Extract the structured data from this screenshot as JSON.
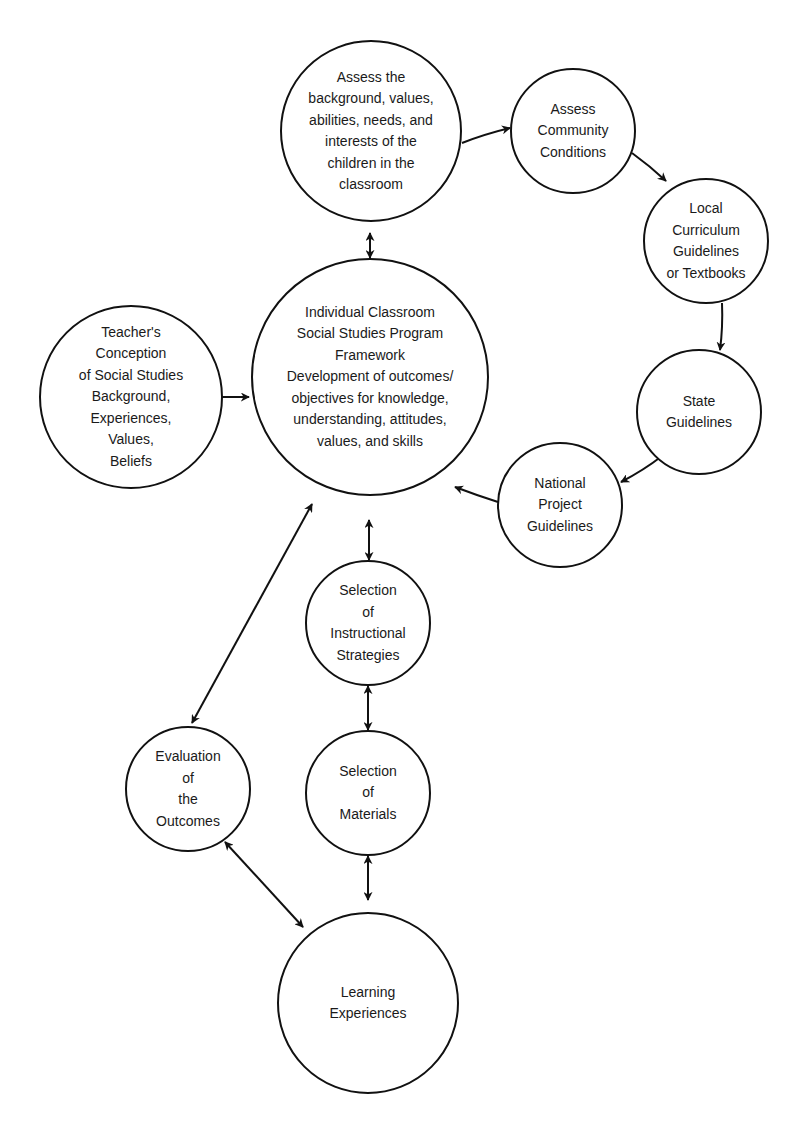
{
  "diagram": {
    "type": "flow-cycle",
    "colors": {
      "stroke": "#111111",
      "text": "#1a1a1a",
      "background": "#ffffff"
    },
    "nodes": [
      {
        "id": "assess-children",
        "label": "Assess the\nbackground, values,\nabilities, needs, and\ninterests of the\nchildren in the\nclassroom",
        "cx": 371,
        "cy": 131,
        "r": 90
      },
      {
        "id": "assess-community",
        "label": "Assess\nCommunity\nConditions",
        "cx": 573,
        "cy": 131,
        "r": 62
      },
      {
        "id": "local-curriculum",
        "label": "Local\nCurriculum\nGuidelines\nor Textbooks",
        "cx": 706,
        "cy": 241,
        "r": 62
      },
      {
        "id": "state-guidelines",
        "label": "State\nGuidelines",
        "cx": 699,
        "cy": 412,
        "r": 62
      },
      {
        "id": "national-project",
        "label": "National\nProject\nGuidelines",
        "cx": 560,
        "cy": 505,
        "r": 62
      },
      {
        "id": "individual-classroom",
        "label": "Individual Classroom\nSocial Studies Program\nFramework\nDevelopment of outcomes/\nobjectives for knowledge,\nunderstanding, attitudes,\nvalues, and skills",
        "cx": 370,
        "cy": 377,
        "r": 118
      },
      {
        "id": "teacher-conception",
        "label": "Teacher's\nConception\nof Social Studies\nBackground,\nExperiences,\nValues,\nBeliefs",
        "cx": 131,
        "cy": 397,
        "r": 91
      },
      {
        "id": "instructional-strategies",
        "label": "Selection\nof\nInstructional\nStrategies",
        "cx": 368,
        "cy": 623,
        "r": 62
      },
      {
        "id": "evaluation",
        "label": "Evaluation\nof\nthe\nOutcomes",
        "cx": 188,
        "cy": 789,
        "r": 62
      },
      {
        "id": "materials",
        "label": "Selection\nof\nMaterials",
        "cx": 368,
        "cy": 793,
        "r": 62
      },
      {
        "id": "learning-experiences",
        "label": "Learning\nExperiences",
        "cx": 368,
        "cy": 1003,
        "r": 90
      }
    ],
    "edges": [
      {
        "from": "assess-children",
        "to": "assess-community",
        "direction": "forward"
      },
      {
        "from": "assess-community",
        "to": "local-curriculum",
        "direction": "forward"
      },
      {
        "from": "local-curriculum",
        "to": "state-guidelines",
        "direction": "forward"
      },
      {
        "from": "state-guidelines",
        "to": "national-project",
        "direction": "forward"
      },
      {
        "from": "national-project",
        "to": "individual-classroom",
        "direction": "forward"
      },
      {
        "from": "assess-children",
        "to": "individual-classroom",
        "direction": "both"
      },
      {
        "from": "teacher-conception",
        "to": "individual-classroom",
        "direction": "both"
      },
      {
        "from": "individual-classroom",
        "to": "instructional-strategies",
        "direction": "both"
      },
      {
        "from": "instructional-strategies",
        "to": "materials",
        "direction": "both"
      },
      {
        "from": "materials",
        "to": "learning-experiences",
        "direction": "both"
      },
      {
        "from": "individual-classroom",
        "to": "evaluation",
        "direction": "both"
      },
      {
        "from": "evaluation",
        "to": "learning-experiences",
        "direction": "both"
      }
    ]
  }
}
